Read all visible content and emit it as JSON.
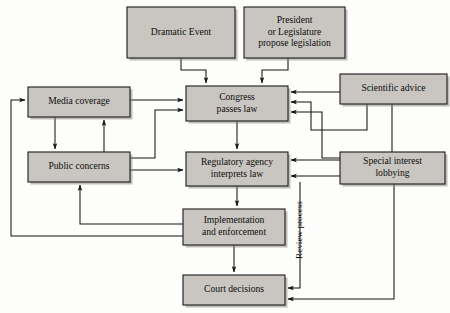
{
  "diagram": {
    "colors": {
      "node_fill": "#c9c6c1",
      "node_stroke": "#1a1a1a",
      "edge": "#141414",
      "background": "#fdfdfb",
      "text": "#0d0d0d"
    },
    "nodes": [
      {
        "id": "dramatic-event",
        "label": "Dramatic Event",
        "lines": [
          "Dramatic Event"
        ],
        "x": 127,
        "y": 7,
        "w": 108,
        "h": 51
      },
      {
        "id": "president-legislature",
        "label": "President or Legislature propose legislation",
        "lines": [
          "President",
          "or Legislature",
          "propose legislation"
        ],
        "x": 244,
        "y": 7,
        "w": 101,
        "h": 51
      },
      {
        "id": "scientific-advice",
        "label": "Scientific advice",
        "lines": [
          "Scientific advice"
        ],
        "x": 340,
        "y": 74,
        "w": 107,
        "h": 30
      },
      {
        "id": "media-coverage",
        "label": "Media coverage",
        "lines": [
          "Media coverage"
        ],
        "x": 28,
        "y": 87,
        "w": 102,
        "h": 30
      },
      {
        "id": "congress-passes-law",
        "label": "Congress passes law",
        "lines": [
          "Congress",
          "passes law"
        ],
        "x": 186,
        "y": 86,
        "w": 102,
        "h": 35
      },
      {
        "id": "public-concerns",
        "label": "Public concerns",
        "lines": [
          "Public concerns"
        ],
        "x": 28,
        "y": 152,
        "w": 102,
        "h": 30
      },
      {
        "id": "regulatory-agency",
        "label": "Regulatory agency interprets law",
        "lines": [
          "Regulatory agency",
          "interprets law"
        ],
        "x": 186,
        "y": 152,
        "w": 102,
        "h": 34
      },
      {
        "id": "special-interest-lobbying",
        "label": "Special interest lobbying",
        "lines": [
          "Special interest",
          "lobbying"
        ],
        "x": 340,
        "y": 152,
        "w": 105,
        "h": 32
      },
      {
        "id": "implementation-enforcement",
        "label": "Implementation and enforcement",
        "lines": [
          "Implementation",
          "and enforcement"
        ],
        "x": 183,
        "y": 209,
        "w": 102,
        "h": 36
      },
      {
        "id": "court-decisions",
        "label": "Court decisions",
        "lines": [
          "Court decisions"
        ],
        "x": 183,
        "y": 275,
        "w": 102,
        "h": 30
      }
    ],
    "edge_labels": [
      {
        "id": "review-process",
        "text": "Review process",
        "x": 302,
        "y": 230,
        "rotation": -90
      }
    ],
    "edges": [
      {
        "id": "dramatic-event-to-congress",
        "from": "dramatic-event",
        "to": "congress-passes-law",
        "path": "M 181 58 L 181 70 L 206 70 L 206 83"
      },
      {
        "id": "president-to-congress",
        "from": "president-legislature",
        "to": "congress-passes-law",
        "path": "M 288 58 L 288 70 L 262 70 L 262 83"
      },
      {
        "id": "media-to-congress",
        "from": "media-coverage",
        "to": "congress-passes-law",
        "path": "M 130 100 L 183 100"
      },
      {
        "id": "media-to-public",
        "from": "media-coverage",
        "to": "public-concerns",
        "path": "M 55 117 L 55 149"
      },
      {
        "id": "public-to-media",
        "from": "public-concerns",
        "to": "media-coverage",
        "path": "M 104 152 L 104 120"
      },
      {
        "id": "public-to-congress",
        "from": "public-concerns",
        "to": "congress-passes-law",
        "path": "M 130 158 L 155 158 L 155 110 L 183 110"
      },
      {
        "id": "public-to-regulatory",
        "from": "public-concerns",
        "to": "regulatory-agency",
        "path": "M 130 170 L 183 170"
      },
      {
        "id": "congress-to-regulatory",
        "from": "congress-passes-law",
        "to": "regulatory-agency",
        "path": "M 237 121 L 237 149"
      },
      {
        "id": "regulatory-to-implementation",
        "from": "regulatory-agency",
        "to": "implementation-enforcement",
        "path": "M 237 186 L 237 206"
      },
      {
        "id": "implementation-to-court",
        "from": "implementation-enforcement",
        "to": "court-decisions",
        "path": "M 234 245 L 234 272"
      },
      {
        "id": "implementation-to-public",
        "from": "implementation-enforcement",
        "to": "public-concerns",
        "path": "M 183 224 L 80 224 L 80 185"
      },
      {
        "id": "implementation-to-media",
        "from": "implementation-enforcement",
        "to": "media-coverage",
        "path": "M 183 236 L 11 236 L 11 100 L 25 100"
      },
      {
        "id": "scientific-to-congress",
        "from": "scientific-advice",
        "to": "congress-passes-law",
        "path": "M 340 92 L 291 92"
      },
      {
        "id": "scientific-to-congress-2",
        "from": "scientific-advice",
        "to": "congress-passes-law",
        "path": "M 367 104 L 367 130 L 311 130 L 311 102 L 291 102"
      },
      {
        "id": "scientific-to-regulatory",
        "from": "scientific-advice",
        "to": "regulatory-agency",
        "path": "M 392 104 L 392 160 L 291 160"
      },
      {
        "id": "lobbying-to-congress",
        "from": "special-interest-lobbying",
        "to": "congress-passes-law",
        "path": "M 340 158 L 322 158 L 322 112 L 291 112"
      },
      {
        "id": "lobbying-to-regulatory",
        "from": "special-interest-lobbying",
        "to": "regulatory-agency",
        "path": "M 340 176 L 291 176"
      },
      {
        "id": "lobbying-to-court",
        "from": "special-interest-lobbying",
        "to": "court-decisions",
        "path": "M 394 184 L 394 299 L 288 299"
      },
      {
        "id": "review-process-to-court",
        "from": "regulatory-agency",
        "to": "court-decisions",
        "path": "M 300 182 L 300 288 L 288 288"
      }
    ]
  }
}
